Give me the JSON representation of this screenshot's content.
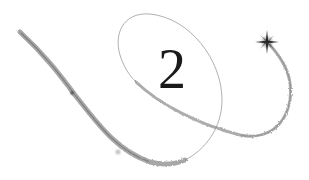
{
  "numeral": "2",
  "colors": {
    "background": "#ffffff",
    "trail": "#7a7a7a",
    "star": "#2a2a2a",
    "numeral": "#1a1a1a"
  },
  "icons": {
    "star": "sparkle-star",
    "trail": "swirl-trail"
  }
}
